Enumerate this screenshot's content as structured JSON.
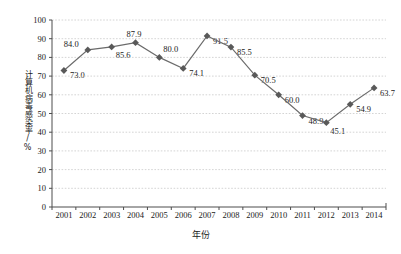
{
  "chart_data": {
    "type": "line",
    "title": "",
    "xlabel": "年份",
    "ylabel": "计算机病毒感染率/%",
    "categories": [
      "2001",
      "2002",
      "2003",
      "2004",
      "2005",
      "2006",
      "2007",
      "2008",
      "2009",
      "2010",
      "2011",
      "2012",
      "2013",
      "2014"
    ],
    "values": [
      73.0,
      84.0,
      85.6,
      87.9,
      80.0,
      74.1,
      91.5,
      85.5,
      70.5,
      60.0,
      48.9,
      45.1,
      54.9,
      63.7
    ],
    "point_labels": [
      "73.0",
      "84.0",
      "85.6",
      "87.9",
      "80.0",
      "74.1",
      "91.5",
      "85.5",
      "70.5",
      "60.0",
      "48.9",
      "45.1",
      "54.9",
      "63.7"
    ],
    "label_positions": [
      "right",
      "above-left",
      "below-right",
      "above",
      "above-right",
      "right",
      "right",
      "right",
      "right",
      "right",
      "right",
      "below-right",
      "right",
      "right"
    ],
    "ylim": [
      0,
      100
    ],
    "y_ticks": [
      "0",
      "10",
      "20",
      "30",
      "40",
      "50",
      "60",
      "70",
      "80",
      "90",
      "100"
    ],
    "y_tick_values": [
      0,
      10,
      20,
      30,
      40,
      50,
      60,
      70,
      80,
      90,
      100
    ],
    "grid": "horizontal-dotted",
    "legend": "none",
    "series_color": "#6b6b6b",
    "marker": "diamond",
    "marker_color": "#595959",
    "gridline_color": "#c9c9c9",
    "axis_color": "#4d4d4d",
    "background": "#ffffff"
  }
}
